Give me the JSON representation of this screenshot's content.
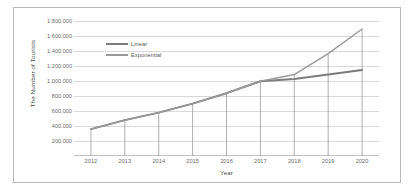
{
  "chart_data": {
    "type": "line",
    "title": "",
    "xlabel": "Year",
    "ylabel": "The Number of Tourists",
    "categories": [
      "2012",
      "2013",
      "2014",
      "2015",
      "2016",
      "2017",
      "2018",
      "2019",
      "2020"
    ],
    "x": [
      2012,
      2013,
      2014,
      2015,
      2016,
      2017,
      2018,
      2019,
      2020
    ],
    "series": [
      {
        "name": "Linear",
        "color": "#7c7c7c",
        "values": [
          360000,
          480000,
          580000,
          700000,
          840000,
          1000000,
          1030000,
          1090000,
          1150000
        ]
      },
      {
        "name": "Exponential",
        "color": "#9a9a9a",
        "values": [
          360000,
          480000,
          580000,
          700000,
          840000,
          1000000,
          1090000,
          1370000,
          1700000
        ]
      }
    ],
    "ylim": [
      0,
      1900000
    ],
    "y_ticks": [
      200000,
      400000,
      600000,
      800000,
      1000000,
      1200000,
      1400000,
      1600000,
      1800000
    ],
    "y_tick_labels": [
      "200.000",
      "400.000",
      "600.000",
      "800.000",
      "1.000.000",
      "1.200.000",
      "1.400.000",
      "1.600.000",
      "1.800.000"
    ],
    "grid": true,
    "legend_position": "upper-left",
    "drop_lines": true,
    "number_format": "dot-thousands-separator"
  },
  "axes": {
    "y_title": "The Number of Tourists",
    "x_title": "Year"
  },
  "legend": {
    "entries": [
      {
        "label": "Linear",
        "color": "#7c7c7c"
      },
      {
        "label": "Exponential",
        "color": "#9a9a9a"
      }
    ]
  },
  "style": {
    "frame_border": "#b8b8b8",
    "gridline": "#d9d9d9",
    "tick_text": "#6d6d6d",
    "axis_title_text": "#4a4a4a",
    "background": "#ffffff"
  }
}
